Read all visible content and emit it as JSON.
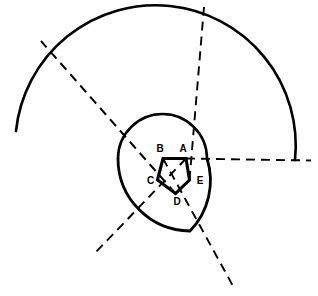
{
  "figure": {
    "background_color": "#ffffff",
    "stroke_color": "#000000",
    "width": 318,
    "height": 296
  },
  "pentagon": {
    "name": "pentagon-ABCDE",
    "vertices": [
      {
        "id": "A",
        "label": "A",
        "x": 186.0,
        "y": 158.5,
        "label_x": 183.0,
        "label_y": 149.0
      },
      {
        "id": "B",
        "label": "B",
        "x": 163.0,
        "y": 158.5,
        "label_x": 160.0,
        "label_y": 149.0
      },
      {
        "id": "C",
        "label": "C",
        "x": 157.5,
        "y": 180.0,
        "label_x": 150.5,
        "label_y": 181.0
      },
      {
        "id": "D",
        "label": "D",
        "x": 175.5,
        "y": 193.5,
        "label_x": 177.0,
        "label_y": 202.5
      },
      {
        "id": "E",
        "label": "E",
        "x": 189.5,
        "y": 180.0,
        "label_x": 200.0,
        "label_y": 181.0
      }
    ],
    "edge_order": [
      "A",
      "B",
      "C",
      "D",
      "E"
    ],
    "edge_width": 3.1,
    "closed": true
  },
  "spiral": {
    "name": "equiangular-spiral",
    "description": "Chain of circular arcs of growing radius forming a spiral",
    "segments": [
      {
        "id": "arc-inner",
        "path": "M 207.0 158.5 A 44.5 44.5 0 0 0 118.0 158.5",
        "stroke_width": 2.6
      },
      {
        "id": "arc-middle",
        "path": "M 118.0 158.5 A 72.5 72.5 0 0 0 190.0 231.0 A 72.5 72.5 0 0 0 207.0 158.5",
        "stroke_width": 2.8
      },
      {
        "id": "arc-outer",
        "path": "M 16.0 131.0 A 118.0 118.0 0 0 1 295.0 160.0",
        "stroke_width": 2.6
      }
    ]
  },
  "rays": {
    "name": "pentagon-diagonal-rays",
    "style": "dashed",
    "dash_pattern": "9 6",
    "items": [
      {
        "id": "ray-east",
        "label": "ray-through-A",
        "x1": 186.0,
        "y1": 158.5,
        "x2": 311.0,
        "y2": 160.5
      },
      {
        "id": "ray-northwest",
        "label": "ray-through-C",
        "x1": 175.5,
        "y1": 193.5,
        "x2": 41.0,
        "y2": 41.0
      },
      {
        "id": "ray-north",
        "label": "ray-through-B",
        "x1": 189.5,
        "y1": 180.0,
        "x2": 204.0,
        "y2": 7.0
      },
      {
        "id": "ray-southwest",
        "label": "ray-through-E",
        "x1": 186.0,
        "y1": 158.5,
        "x2": 94.0,
        "y2": 254.0
      },
      {
        "id": "ray-southeast",
        "label": "ray-through-D",
        "x1": 163.0,
        "y1": 158.5,
        "x2": 233.0,
        "y2": 286.0
      }
    ]
  }
}
